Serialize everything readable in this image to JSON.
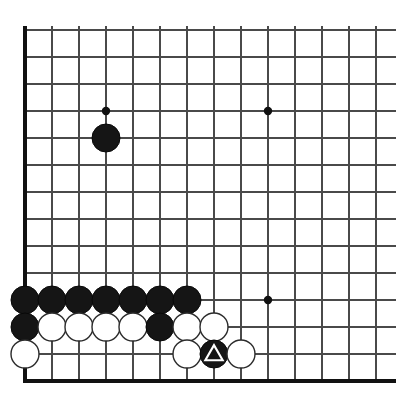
{
  "diagram": {
    "kind": "go-board-diagram",
    "board_size_visible_columns": 14,
    "board_size_visible_rows": 13,
    "background_color": "#ffffff",
    "line_color": "#4a4a4a",
    "edge_color": "#111111",
    "black_stone_color": "#151515",
    "white_stone_color": "#ffffff",
    "stone_outline_color": "#2b2b2b",
    "mark_color_on_black": "#ffffff"
  },
  "geometry": {
    "origin_x": 25,
    "origin_y": 30,
    "spacing": 27,
    "columns": 14,
    "rows": 13,
    "stone_radius": 14.0,
    "star_radius": 4.2,
    "left_edge_x": 25,
    "bottom_edge_y": 381,
    "line_right_extent": 396,
    "line_top_extent": 26
  },
  "star_points": [
    {
      "name": "star-point-upper-left",
      "col": 4,
      "row": 4
    },
    {
      "name": "star-point-upper-right",
      "col": 10,
      "row": 4
    },
    {
      "name": "star-point-lower-right",
      "col": 10,
      "row": 11
    }
  ],
  "stones": [
    {
      "name": "stone-black-d5",
      "color": "black",
      "col": 4,
      "row": 5,
      "mark": "none"
    },
    {
      "name": "stone-black-a11",
      "color": "black",
      "col": 1,
      "row": 11,
      "mark": "none"
    },
    {
      "name": "stone-black-b11",
      "color": "black",
      "col": 2,
      "row": 11,
      "mark": "none"
    },
    {
      "name": "stone-black-c11",
      "color": "black",
      "col": 3,
      "row": 11,
      "mark": "none"
    },
    {
      "name": "stone-black-d11",
      "color": "black",
      "col": 4,
      "row": 11,
      "mark": "none"
    },
    {
      "name": "stone-black-e11",
      "color": "black",
      "col": 5,
      "row": 11,
      "mark": "none"
    },
    {
      "name": "stone-black-f11",
      "color": "black",
      "col": 6,
      "row": 11,
      "mark": "none"
    },
    {
      "name": "stone-black-g11",
      "color": "black",
      "col": 7,
      "row": 11,
      "mark": "none"
    },
    {
      "name": "stone-black-a12",
      "color": "black",
      "col": 1,
      "row": 12,
      "mark": "none"
    },
    {
      "name": "stone-white-b12",
      "color": "white",
      "col": 2,
      "row": 12,
      "mark": "none"
    },
    {
      "name": "stone-white-c12",
      "color": "white",
      "col": 3,
      "row": 12,
      "mark": "none"
    },
    {
      "name": "stone-white-d12",
      "color": "white",
      "col": 4,
      "row": 12,
      "mark": "none"
    },
    {
      "name": "stone-white-e12",
      "color": "white",
      "col": 5,
      "row": 12,
      "mark": "none"
    },
    {
      "name": "stone-black-f12",
      "color": "black",
      "col": 6,
      "row": 12,
      "mark": "none"
    },
    {
      "name": "stone-white-g12",
      "color": "white",
      "col": 7,
      "row": 12,
      "mark": "none"
    },
    {
      "name": "stone-white-h12",
      "color": "white",
      "col": 8,
      "row": 12,
      "mark": "none"
    },
    {
      "name": "stone-white-a13",
      "color": "white",
      "col": 1,
      "row": 13,
      "mark": "none"
    },
    {
      "name": "stone-white-g13",
      "color": "white",
      "col": 7,
      "row": 13,
      "mark": "none"
    },
    {
      "name": "stone-black-h13-marked",
      "color": "black",
      "col": 8,
      "row": 13,
      "mark": "triangle"
    },
    {
      "name": "stone-white-i13",
      "color": "white",
      "col": 9,
      "row": 13,
      "mark": "none"
    }
  ]
}
